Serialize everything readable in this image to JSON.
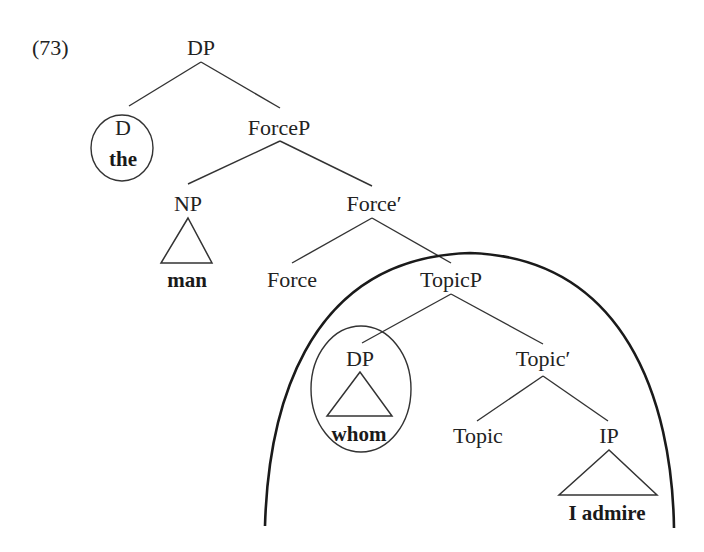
{
  "example_number": "(73)",
  "nodes": {
    "root_dp": "DP",
    "d": "D",
    "d_word": "the",
    "forcep": "ForceP",
    "np": "NP",
    "np_word": "man",
    "force_bar": "Force′",
    "force": "Force",
    "topicp": "TopicP",
    "spec_dp": "DP",
    "spec_dp_word": "whom",
    "topic_bar": "Topic′",
    "topic": "Topic",
    "ip": "IP",
    "ip_word": "I admire"
  },
  "annotations": {
    "circled": [
      "D the",
      "DP whom"
    ],
    "arc_encloses": "TopicP"
  },
  "colors": {
    "ink": "#222222",
    "background": "#ffffff"
  }
}
